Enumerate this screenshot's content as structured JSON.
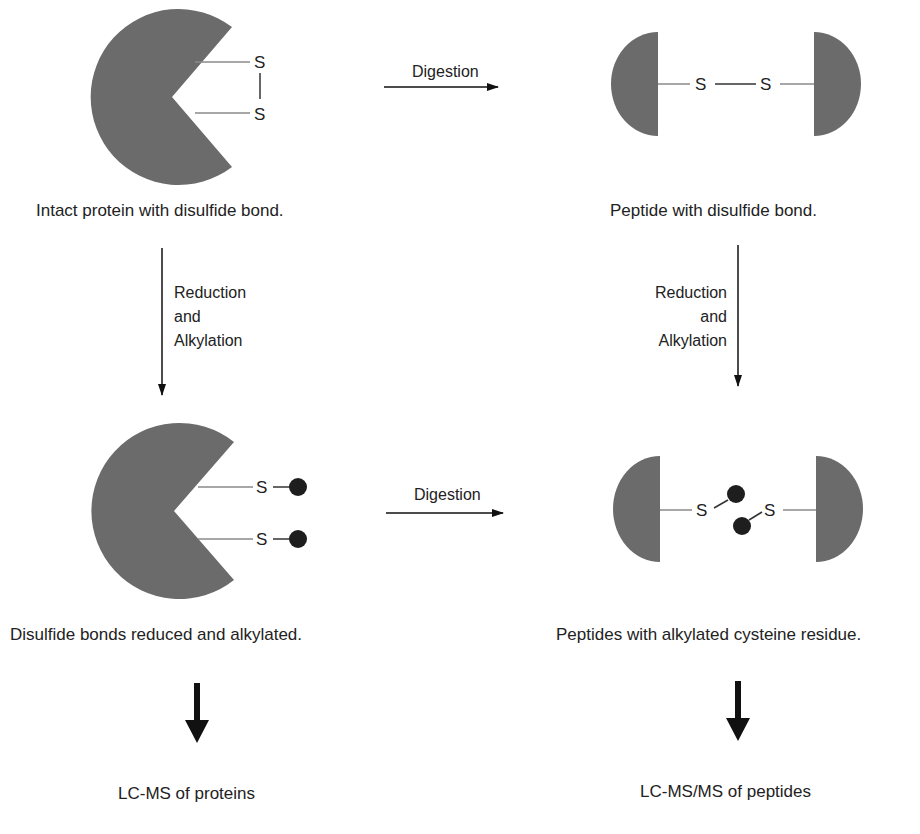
{
  "colors": {
    "protein_fill": "#6b6b6b",
    "bond_line": "#8a8a8a",
    "alkyl_dot": "#1e1e1e",
    "arrow": "#111111",
    "text": "#222222"
  },
  "atoms": {
    "sulfur": "S"
  },
  "steps": {
    "intact_protein": {
      "caption": "Intact protein with disulfide bond."
    },
    "peptide_disulfide": {
      "caption": "Peptide with disulfide bond."
    },
    "protein_reduced": {
      "caption": "Disulfide bonds reduced and alkylated."
    },
    "peptides_alkylated": {
      "caption": "Peptides with alkylated cysteine residue."
    }
  },
  "arrows": {
    "digestion_top": {
      "label": "Digestion"
    },
    "digestion_bottom": {
      "label": "Digestion"
    },
    "reduction_left": {
      "line1": "Reduction",
      "line2": "and",
      "line3": "Alkylation"
    },
    "reduction_right": {
      "line1": "Reduction",
      "line2": "and",
      "line3": "Alkylation"
    }
  },
  "outputs": {
    "left": {
      "label": "LC-MS of proteins"
    },
    "right": {
      "label": "LC-MS/MS of peptides"
    }
  }
}
